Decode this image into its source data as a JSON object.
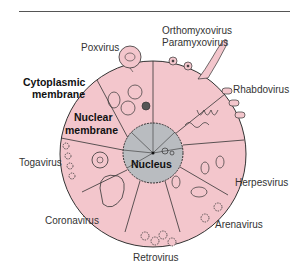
{
  "diagram": {
    "center_labels": {
      "nucleus": "Nucleus",
      "nuclear_membrane": [
        "Nuclear",
        "membrane"
      ],
      "cytoplasmic_membrane": [
        "Cytoplasmic",
        "membrane"
      ]
    },
    "virus_labels": {
      "poxvirus": "Poxvirus",
      "orthomyxovirus": "Orthomyxovirus",
      "paramyxovirus": "Paramyxovirus",
      "rhabdovirus": "Rhabdovirus",
      "togavirus": "Togavirus",
      "herpesvirus": "Herpesvirus",
      "coronavirus": "Coronavirus",
      "arenavirus": "Arenavirus",
      "retrovirus": "Retrovirus"
    },
    "colors": {
      "cytoplasm": "#f3c6cc",
      "nucleus": "#b9bcc0",
      "outline": "#333333"
    }
  }
}
